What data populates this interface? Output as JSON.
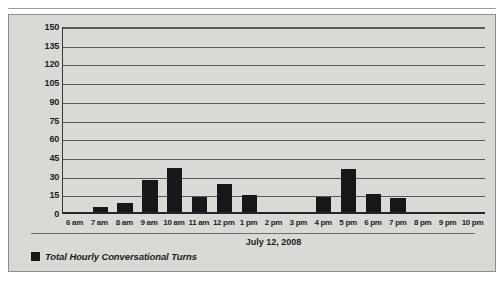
{
  "figure": {
    "background_color": "#d9d9d6",
    "bar_color": "#17171a",
    "legend": {
      "swatch_name": "legend-color-swatch",
      "label": "Total Hourly Conversational Turns"
    },
    "xaxis_title": "July 12, 2008"
  },
  "chart_data": {
    "type": "bar",
    "title": "",
    "subtitle": "",
    "xlabel": "July 12, 2008",
    "ylabel": "",
    "ylim": [
      0,
      150
    ],
    "yticks": [
      0,
      15,
      30,
      45,
      60,
      75,
      90,
      105,
      120,
      135,
      150
    ],
    "grid": true,
    "legend_position": "below-axis-left",
    "categories": [
      "6 am",
      "7 am",
      "8 am",
      "9 am",
      "10 am",
      "11 am",
      "12 pm",
      "1 pm",
      "2 pm",
      "3 pm",
      "4 pm",
      "5 pm",
      "6 pm",
      "7 pm",
      "8 pm",
      "9 pm",
      "10 pm"
    ],
    "series": [
      {
        "name": "Total Hourly Conversational Turns",
        "color": "#17171a",
        "values": [
          1,
          6,
          9,
          27,
          37,
          14,
          24,
          15,
          0,
          0,
          14,
          36,
          16,
          13,
          0,
          0,
          0
        ]
      }
    ]
  }
}
